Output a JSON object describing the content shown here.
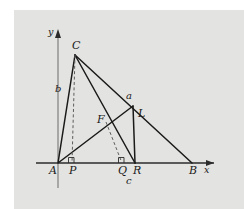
{
  "figure": {
    "type": "geometry-diagram",
    "background_color": "#e3e3e1",
    "stroke_color": "#1a1a1a",
    "axes": {
      "x_label": "x",
      "y_label": "y",
      "origin_label": "A"
    },
    "points": [
      {
        "name": "A",
        "label": "A",
        "x": 58,
        "y": 163,
        "label_dx": -9,
        "label_dy": 4
      },
      {
        "name": "P",
        "label": "P",
        "x": 72,
        "y": 163,
        "label_dx": -3,
        "label_dy": 4
      },
      {
        "name": "Q",
        "label": "Q",
        "x": 122,
        "y": 163,
        "label_dx": -4,
        "label_dy": 4
      },
      {
        "name": "R",
        "label": "R",
        "x": 135,
        "y": 163,
        "label_dx": -2,
        "label_dy": 4
      },
      {
        "name": "B",
        "label": "B",
        "x": 192,
        "y": 163,
        "label_dx": -3,
        "label_dy": 4
      },
      {
        "name": "C",
        "label": "C",
        "x": 75,
        "y": 55,
        "label_dx": -2,
        "label_dy": -14
      },
      {
        "name": "F",
        "label": "F",
        "x": 106,
        "y": 122,
        "label_dx": -9,
        "label_dy": -4
      },
      {
        "name": "L",
        "label": "L",
        "x": 133,
        "y": 106,
        "label_dx": 5,
        "label_dy": 6
      }
    ],
    "side_labels": [
      {
        "name": "b",
        "label": "b",
        "x": 58,
        "y": 88
      },
      {
        "name": "a",
        "label": "a",
        "x": 128,
        "y": 96
      },
      {
        "name": "c",
        "label": "c",
        "x": 128,
        "y": 180
      }
    ],
    "segments": [
      {
        "name": "segment-AC",
        "from": "A",
        "to": "C",
        "style": "solid"
      },
      {
        "name": "segment-CR",
        "from": "C",
        "to": "R",
        "style": "solid"
      },
      {
        "name": "segment-CB",
        "from": "C",
        "to": "B",
        "style": "solid"
      },
      {
        "name": "segment-AL",
        "from": "A",
        "to": "L",
        "style": "solid"
      },
      {
        "name": "segment-LR",
        "from": "L",
        "to": "R",
        "style": "solid"
      },
      {
        "name": "altitude-CP",
        "from": "C",
        "to": "P",
        "style": "dashed"
      },
      {
        "name": "altitude-FQ",
        "from": "F",
        "to": "Q",
        "style": "dashed"
      }
    ],
    "right_angle_marks": [
      {
        "name": "right-angle-P",
        "x": 72,
        "y": 163
      },
      {
        "name": "right-angle-Q",
        "x": 122,
        "y": 163
      }
    ]
  }
}
